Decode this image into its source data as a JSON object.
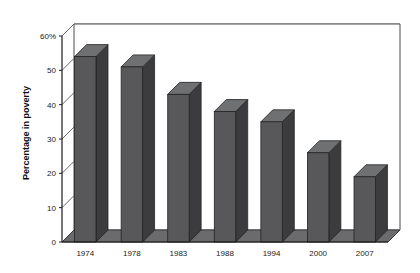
{
  "chart_data": {
    "type": "bar",
    "title": "",
    "subtitle": "",
    "xlabel": "",
    "ylabel": "Percentage in poverty",
    "categories": [
      "1974",
      "1978",
      "1983",
      "1988",
      "1994",
      "2000",
      "2007"
    ],
    "values": [
      54,
      51,
      43,
      38,
      35,
      26,
      19
    ],
    "ylim": [
      0,
      60
    ],
    "yticks": [
      0,
      10,
      20,
      30,
      40,
      50,
      60
    ],
    "ytick_labels": [
      "0",
      "10",
      "20",
      "30",
      "40",
      "50",
      "60%"
    ],
    "grid": true,
    "grid_axis": "y",
    "legend": false,
    "legend_position": "none",
    "style": "3d",
    "bar_color": "#58585a",
    "bar_top_color": "#6f7072",
    "bar_side_color": "#3c3c3e",
    "axis_color": "#1a1a1a",
    "grid_color": "#8a8a8a",
    "background": "#ffffff"
  },
  "axes": {
    "y_label": "Percentage in poverty",
    "y_ticks": [
      "60%",
      "50",
      "40",
      "30",
      "20",
      "10",
      "0"
    ],
    "x_ticks": [
      "1974",
      "1978",
      "1983",
      "1988",
      "1994",
      "2000",
      "2007"
    ]
  }
}
